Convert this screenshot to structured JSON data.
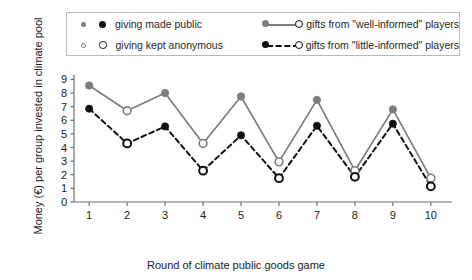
{
  "legend": {
    "rows": [
      {
        "marker_small": "dot-filled-gray",
        "marker_big": "dot-filled-black",
        "label": "giving made public",
        "sample": "solid-line-gray-filled-to-open",
        "series_label": "gifts from \"well-informed\" players"
      },
      {
        "marker_small": "circle-open-gray",
        "marker_big": "circle-open-black",
        "label": "giving kept anonymous",
        "sample": "dashed-line-black-filled-to-open",
        "series_label": "gifts from \"little-informed\" players"
      }
    ]
  },
  "axes": {
    "ylabel": "Money (€) per group invested in climate pool",
    "xlabel": "Round of climate public goods game",
    "yticks": [
      0,
      1,
      2,
      3,
      4,
      5,
      6,
      7,
      8,
      9
    ],
    "xticks": [
      1,
      2,
      3,
      4,
      5,
      6,
      7,
      8,
      9,
      10
    ]
  },
  "colors": {
    "well_informed": "#7d7d7d",
    "little_informed": "#111111",
    "axis": "#6f6f6f",
    "legend_border": "#b9b9b9",
    "background": "#ffffff"
  },
  "chart_data": {
    "type": "line",
    "title": "",
    "xlabel": "Round of climate public goods game",
    "ylabel": "Money (€) per group invested in climate pool",
    "x": [
      1,
      2,
      3,
      4,
      5,
      6,
      7,
      8,
      9,
      10
    ],
    "xlim": [
      0.6,
      10.4
    ],
    "ylim": [
      0,
      9.4
    ],
    "grid": false,
    "legend_position": "top",
    "marker_fill_by_round": [
      "filled",
      "open",
      "filled",
      "open",
      "filled",
      "open",
      "filled",
      "open",
      "filled",
      "open"
    ],
    "marker_meaning": {
      "filled": "giving made public",
      "open": "giving kept anonymous"
    },
    "series": [
      {
        "name": "gifts from \"well-informed\" players",
        "color": "#7d7d7d",
        "linestyle": "solid",
        "values": [
          8.55,
          6.7,
          8.0,
          4.3,
          7.75,
          2.95,
          7.5,
          2.3,
          6.8,
          1.75
        ]
      },
      {
        "name": "gifts from \"little-informed\" players",
        "color": "#111111",
        "linestyle": "dashed",
        "values": [
          6.85,
          4.3,
          5.55,
          2.3,
          4.9,
          1.75,
          5.6,
          1.85,
          5.75,
          1.15
        ]
      }
    ]
  }
}
